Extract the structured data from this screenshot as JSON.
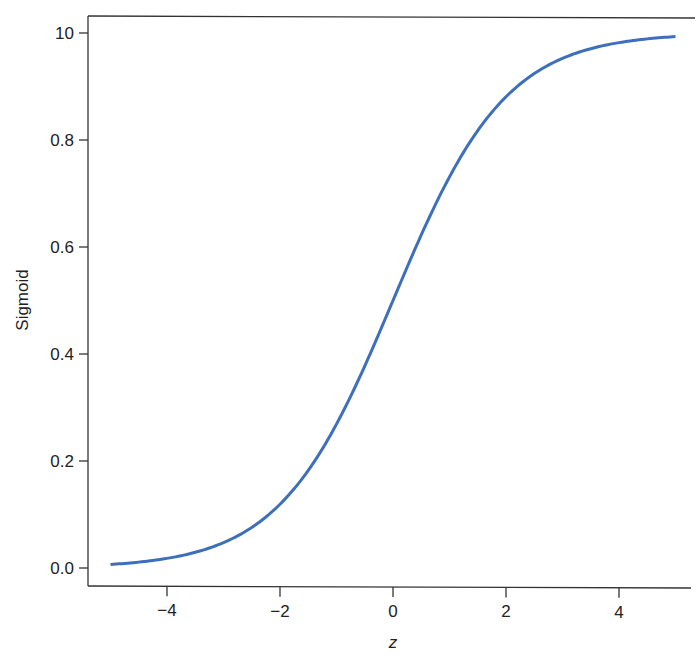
{
  "chart_data": {
    "type": "line",
    "title": "",
    "xlabel": "z",
    "ylabel": "Sigmoid",
    "xlim": [
      -5.4,
      5.3
    ],
    "ylim": [
      -0.03,
      1.03
    ],
    "x_ticks": [
      -4,
      -2,
      0,
      2,
      4
    ],
    "x_tick_labels": [
      "−4",
      "−2",
      "0",
      "2",
      "4"
    ],
    "y_ticks": [
      0.0,
      0.2,
      0.4,
      0.6,
      0.8,
      1.0
    ],
    "y_tick_labels": [
      "0.0",
      "0.2",
      "0.4",
      "0.6",
      "0.8",
      "10"
    ],
    "grid": false,
    "legend": null,
    "series": [
      {
        "name": "sigmoid(z)",
        "color": "#3d6fbd",
        "x": [
          -5,
          -4.5,
          -4,
          -3.5,
          -3,
          -2.5,
          -2,
          -1.5,
          -1,
          -0.5,
          0,
          0.5,
          1,
          1.5,
          2,
          2.5,
          3,
          3.5,
          4,
          4.5,
          5
        ],
        "values": [
          0.007,
          0.011,
          0.018,
          0.029,
          0.047,
          0.076,
          0.119,
          0.182,
          0.269,
          0.378,
          0.5,
          0.622,
          0.731,
          0.818,
          0.881,
          0.924,
          0.953,
          0.971,
          0.982,
          0.989,
          0.993
        ]
      }
    ]
  },
  "labels": {
    "xlabel": "z",
    "ylabel": "Sigmoid"
  },
  "colors": {
    "curve": "#3d6fbd",
    "axis": "#333333"
  }
}
